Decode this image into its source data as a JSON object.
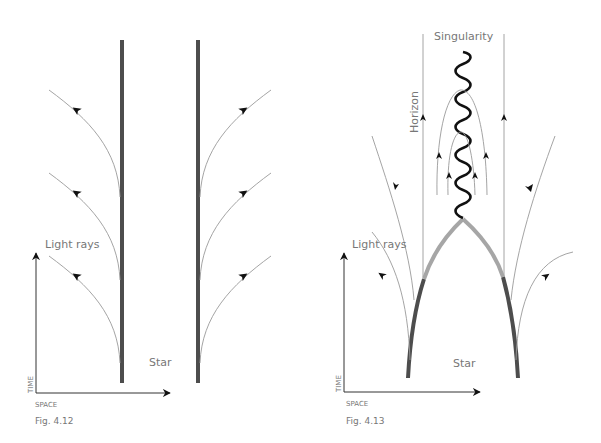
{
  "figures": [
    {
      "id": "fig-4-12",
      "caption": "Fig. 4.12",
      "labels": {
        "light_rays": "Light rays",
        "star": "Star",
        "time_axis": "TIME",
        "space_axis": "SPACE"
      }
    },
    {
      "id": "fig-4-13",
      "caption": "Fig. 4.13",
      "labels": {
        "singularity": "Singularity",
        "horizon": "Horizon",
        "light_rays": "Light rays",
        "star": "Star",
        "time_axis": "TIME",
        "space_axis": "SPACE"
      }
    }
  ],
  "colors": {
    "star_surface": "#4d4d4d",
    "star_inside_horizon": "#a6a6a6",
    "light_ray": "#9a9a9a",
    "singularity": "#111111",
    "text": "#777777"
  }
}
